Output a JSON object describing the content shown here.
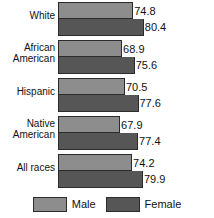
{
  "chart_data": {
    "type": "bar",
    "orientation": "horizontal",
    "title": "",
    "subtitle": "",
    "xlabel": "",
    "ylabel": "",
    "grid": false,
    "legend_position": "bottom",
    "xlim": [
      55,
      85
    ],
    "categories": [
      "White",
      "African American",
      "Hispanic",
      "Native American",
      "All races"
    ],
    "series": [
      {
        "name": "Male",
        "color": "#8d8d8d",
        "values": [
          74.8,
          68.9,
          70.5,
          67.9,
          74.2
        ]
      },
      {
        "name": "Female",
        "color": "#565656",
        "values": [
          80.4,
          75.6,
          77.6,
          77.4,
          79.9
        ]
      }
    ]
  },
  "groups": [
    {
      "label_line1": "White",
      "label_line2": "",
      "male": {
        "value": "74.8",
        "pct": 66.0
      },
      "female": {
        "value": "80.4",
        "pct": 75.3
      }
    },
    {
      "label_line1": "African",
      "label_line2": "American",
      "male": {
        "value": "68.9",
        "pct": 56.2
      },
      "female": {
        "value": "75.6",
        "pct": 67.3
      }
    },
    {
      "label_line1": "Hispanic",
      "label_line2": "",
      "male": {
        "value": "70.5",
        "pct": 58.8
      },
      "female": {
        "value": "77.6",
        "pct": 70.6
      }
    },
    {
      "label_line1": "Native",
      "label_line2": "American",
      "male": {
        "value": "67.9",
        "pct": 54.5
      },
      "female": {
        "value": "77.4",
        "pct": 70.3
      }
    },
    {
      "label_line1": "All races",
      "label_line2": "",
      "male": {
        "value": "74.2",
        "pct": 65.0
      },
      "female": {
        "value": "79.9",
        "pct": 74.5
      }
    }
  ],
  "legend": {
    "male_label": "Male",
    "female_label": "Female"
  },
  "colors": {
    "male": "#8d8d8d",
    "female": "#565656",
    "outline": "#2b2b2b",
    "text": "#111111",
    "background": "#ffffff"
  }
}
